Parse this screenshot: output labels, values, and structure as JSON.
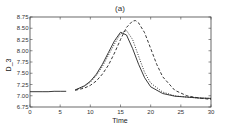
{
  "chart_data": {
    "type": "line",
    "title": "(a)",
    "xlabel": "Time",
    "ylabel": "D_3",
    "xlim": [
      0,
      30
    ],
    "ylim": [
      6.75,
      8.75
    ],
    "xticks": [
      0,
      5,
      10,
      15,
      20,
      25,
      30
    ],
    "yticks": [
      6.75,
      7.0,
      7.25,
      7.5,
      7.75,
      8.0,
      8.25,
      8.5,
      8.75
    ],
    "ytick_labels": [
      "6.75",
      "7.00",
      "7.25",
      "7.50",
      "7.75",
      "8.00",
      "8.25",
      "8.50",
      "8.75"
    ],
    "grid": false,
    "legend": null,
    "series": [
      {
        "name": "baseline (initial segment)",
        "style": "solid",
        "x": [
          0,
          1,
          2,
          3,
          4,
          5,
          6
        ],
        "y": [
          7.09,
          7.09,
          7.09,
          7.09,
          7.1,
          7.1,
          7.1
        ]
      },
      {
        "name": "solid",
        "style": "solid",
        "x": [
          7.5,
          9,
          10,
          11,
          12,
          13,
          14,
          15,
          16,
          17,
          18,
          19,
          20,
          22,
          24,
          26,
          28,
          30
        ],
        "y": [
          7.13,
          7.22,
          7.32,
          7.48,
          7.7,
          7.96,
          8.22,
          8.41,
          8.35,
          8.05,
          7.7,
          7.4,
          7.2,
          7.05,
          6.99,
          6.97,
          6.95,
          6.94
        ]
      },
      {
        "name": "dotted",
        "style": "dotted",
        "x": [
          7.5,
          9,
          10,
          11,
          12,
          13,
          14,
          15,
          16,
          17,
          18,
          19,
          20,
          22,
          24,
          26,
          28,
          30
        ],
        "y": [
          7.13,
          7.21,
          7.3,
          7.45,
          7.65,
          7.9,
          8.15,
          8.38,
          8.45,
          8.25,
          7.88,
          7.52,
          7.28,
          7.08,
          7.0,
          6.97,
          6.95,
          6.94
        ]
      },
      {
        "name": "dashed",
        "style": "dashed",
        "x": [
          7.5,
          9,
          10,
          11,
          12,
          13,
          14,
          15,
          16,
          17,
          17.5,
          18,
          19,
          20,
          21,
          22,
          24,
          26,
          28,
          30
        ],
        "y": [
          7.12,
          7.17,
          7.23,
          7.33,
          7.48,
          7.68,
          7.95,
          8.25,
          8.52,
          8.66,
          8.67,
          8.62,
          8.4,
          8.05,
          7.7,
          7.42,
          7.12,
          7.0,
          6.95,
          6.92
        ]
      }
    ]
  }
}
